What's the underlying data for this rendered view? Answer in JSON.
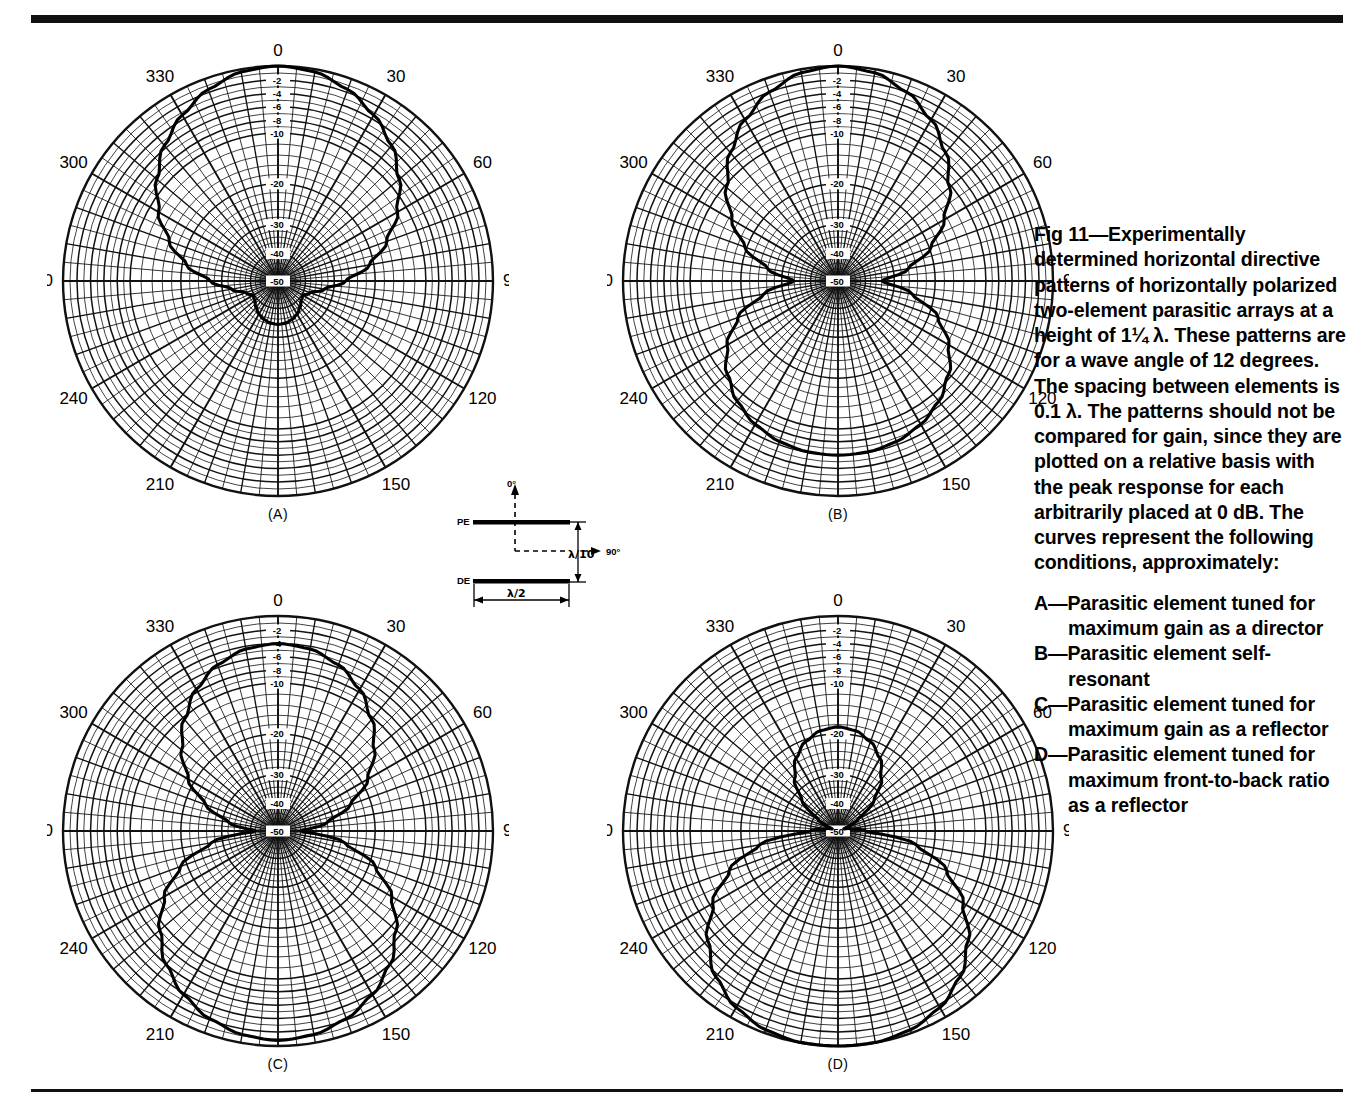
{
  "figure": {
    "caption_paragraph": "Fig 11—Experimentally determined horizontal directive patterns of horizontally polarized two-element parasitic arrays at a height of 1¼ λ. These patterns are for a wave angle of 12 degrees. The spacing between elements is 0.1 λ. The patterns should not be compared for gain, since they are plotted on a relative basis with the peak response for each arbitrarily placed at 0 dB. The curves represent the following conditions, approximately:",
    "conditions": [
      "A—Parasitic element tuned for maximum gain as a director",
      "B—Parasitic element self-resonant",
      "C—Parasitic element tuned for maximum gain as a reflector",
      "D—Parasitic element tuned for maximum front-to-back ratio as a reflector"
    ]
  },
  "antenna_diagram": {
    "parasitic_element_label": "PE",
    "driven_element_label": "DE",
    "spacing_label": "λ/10",
    "length_label": "λ/2",
    "direction_up_label": "0°",
    "direction_right_label": "90°"
  },
  "panels": [
    {
      "id": "A",
      "label": "(A)"
    },
    {
      "id": "B",
      "label": "(B)"
    },
    {
      "id": "C",
      "label": "(C)"
    },
    {
      "id": "D",
      "label": "(D)"
    }
  ],
  "chart_data": [
    {
      "type": "line",
      "plot_kind": "polar-antenna-pattern",
      "panel": "A",
      "title": "(A)",
      "annotation": "Parasitic element tuned for maximum gain as a director",
      "angle_unit": "degrees",
      "angle_tick_labels": [
        "0",
        "30",
        "60",
        "90",
        "120",
        "150",
        "180",
        "210",
        "240",
        "270",
        "300",
        "330"
      ],
      "angle_ticks": [
        0,
        30,
        60,
        90,
        120,
        150,
        180,
        210,
        240,
        270,
        300,
        330
      ],
      "angle_minor_step": 5,
      "radial_unit": "dB",
      "radial_tick_labels": [
        "-2",
        "-4",
        "-6",
        "-8",
        "-10",
        "-20",
        "-30",
        "-40",
        "-50"
      ],
      "radial_ticks": [
        -2,
        -4,
        -6,
        -8,
        -10,
        -20,
        -30,
        -40,
        -50
      ],
      "rlim": [
        -50,
        0
      ],
      "grid": true,
      "legend": "none",
      "angles": [
        0,
        10,
        20,
        30,
        40,
        50,
        60,
        70,
        80,
        90,
        100,
        110,
        120,
        130,
        140,
        150,
        160,
        170,
        180,
        190,
        200,
        210,
        220,
        230,
        240,
        250,
        260,
        270,
        280,
        290,
        300,
        310,
        320,
        330,
        340,
        350
      ],
      "values_db": [
        0,
        -0.4,
        -1.6,
        -3.4,
        -5.6,
        -8.4,
        -11.8,
        -16.0,
        -21.0,
        -27.0,
        -33.0,
        -37.5,
        -39.5,
        -39.0,
        -37.5,
        -36.0,
        -35.0,
        -34.4,
        -34.2,
        -34.4,
        -35.0,
        -36.0,
        -37.5,
        -39.0,
        -39.5,
        -37.5,
        -33.0,
        -27.0,
        -21.0,
        -16.0,
        -11.8,
        -8.4,
        -5.6,
        -3.4,
        -1.6,
        -0.4
      ]
    },
    {
      "type": "line",
      "plot_kind": "polar-antenna-pattern",
      "panel": "B",
      "title": "(B)",
      "annotation": "Parasitic element self-resonant",
      "angle_unit": "degrees",
      "angle_tick_labels": [
        "0",
        "30",
        "60",
        "90",
        "120",
        "150",
        "180",
        "210",
        "240",
        "270",
        "300",
        "330"
      ],
      "angle_ticks": [
        0,
        30,
        60,
        90,
        120,
        150,
        180,
        210,
        240,
        270,
        300,
        330
      ],
      "angle_minor_step": 5,
      "radial_unit": "dB",
      "radial_tick_labels": [
        "-2",
        "-4",
        "-6",
        "-8",
        "-10",
        "-20",
        "-30",
        "-40",
        "-50"
      ],
      "radial_ticks": [
        -2,
        -4,
        -6,
        -8,
        -10,
        -20,
        -30,
        -40,
        -50
      ],
      "rlim": [
        -50,
        0
      ],
      "grid": true,
      "legend": "none",
      "angles": [
        0,
        10,
        20,
        30,
        40,
        50,
        60,
        70,
        80,
        90,
        100,
        110,
        120,
        130,
        140,
        150,
        160,
        170,
        180,
        190,
        200,
        210,
        220,
        230,
        240,
        250,
        260,
        270,
        280,
        290,
        300,
        310,
        320,
        330,
        340,
        350
      ],
      "values_db": [
        0,
        -0.5,
        -2.0,
        -4.2,
        -7.0,
        -10.4,
        -14.6,
        -19.6,
        -26.0,
        -34.0,
        -25.0,
        -18.0,
        -13.6,
        -10.6,
        -8.6,
        -7.3,
        -6.5,
        -6.1,
        -6.0,
        -6.1,
        -6.5,
        -7.3,
        -8.6,
        -10.6,
        -13.6,
        -18.0,
        -25.0,
        -34.0,
        -26.0,
        -19.6,
        -14.6,
        -10.4,
        -7.0,
        -4.2,
        -2.0,
        -0.5
      ]
    },
    {
      "type": "line",
      "plot_kind": "polar-antenna-pattern",
      "panel": "C",
      "title": "(C)",
      "annotation": "Parasitic element tuned for maximum gain as a reflector",
      "angle_unit": "degrees",
      "angle_tick_labels": [
        "0",
        "30",
        "60",
        "90",
        "120",
        "150",
        "180",
        "210",
        "240",
        "270",
        "300",
        "330"
      ],
      "angle_ticks": [
        0,
        30,
        60,
        90,
        120,
        150,
        180,
        210,
        240,
        270,
        300,
        330
      ],
      "angle_minor_step": 5,
      "radial_unit": "dB",
      "radial_tick_labels": [
        "-2",
        "-4",
        "-6",
        "-8",
        "-10",
        "-20",
        "-30",
        "-40",
        "-50"
      ],
      "radial_ticks": [
        -2,
        -4,
        -6,
        -8,
        -10,
        -20,
        -30,
        -40,
        -50
      ],
      "rlim": [
        -50,
        0
      ],
      "grid": true,
      "legend": "none",
      "angles": [
        0,
        10,
        20,
        30,
        40,
        50,
        60,
        70,
        80,
        90,
        100,
        110,
        120,
        130,
        140,
        150,
        160,
        170,
        180,
        190,
        200,
        210,
        220,
        230,
        240,
        250,
        260,
        270,
        280,
        290,
        300,
        310,
        320,
        330,
        340,
        350
      ],
      "values_db": [
        -4.0,
        -4.4,
        -5.6,
        -7.6,
        -10.4,
        -14.0,
        -18.6,
        -24.6,
        -32.0,
        -42.0,
        -27.0,
        -18.6,
        -13.0,
        -9.0,
        -6.0,
        -3.8,
        -2.2,
        -1.2,
        -0.8,
        -1.2,
        -2.2,
        -3.8,
        -6.0,
        -9.0,
        -13.0,
        -18.6,
        -27.0,
        -42.0,
        -32.0,
        -24.6,
        -18.6,
        -14.0,
        -10.4,
        -7.6,
        -5.6,
        -4.4
      ]
    },
    {
      "type": "line",
      "plot_kind": "polar-antenna-pattern",
      "panel": "D",
      "title": "(D)",
      "annotation": "Parasitic element tuned for maximum front-to-back ratio as a reflector",
      "angle_unit": "degrees",
      "angle_tick_labels": [
        "0",
        "30",
        "60",
        "90",
        "120",
        "150",
        "180",
        "210",
        "240",
        "270",
        "300",
        "330"
      ],
      "angle_ticks": [
        0,
        30,
        60,
        90,
        120,
        150,
        180,
        210,
        240,
        270,
        300,
        330
      ],
      "angle_minor_step": 5,
      "radial_unit": "dB",
      "radial_tick_labels": [
        "-2",
        "-4",
        "-6",
        "-8",
        "-10",
        "-20",
        "-30",
        "-40",
        "-50"
      ],
      "radial_ticks": [
        -2,
        -4,
        -6,
        -8,
        -10,
        -20,
        -30,
        -40,
        -50
      ],
      "rlim": [
        -50,
        0
      ],
      "grid": true,
      "legend": "none",
      "angles": [
        0,
        10,
        20,
        30,
        40,
        50,
        60,
        70,
        80,
        90,
        100,
        110,
        120,
        130,
        140,
        150,
        160,
        170,
        180,
        190,
        200,
        210,
        220,
        230,
        240,
        250,
        260,
        270,
        280,
        290,
        300,
        310,
        320,
        330,
        340,
        350
      ],
      "values_db": [
        -18.5,
        -19.0,
        -20.5,
        -23.0,
        -27.0,
        -33.0,
        -42.0,
        -48.0,
        -46.0,
        -40.0,
        -24.0,
        -16.0,
        -10.6,
        -6.6,
        -3.6,
        -1.6,
        -0.5,
        -0.05,
        0,
        -0.05,
        -0.5,
        -1.6,
        -3.6,
        -6.6,
        -10.6,
        -16.0,
        -24.0,
        -40.0,
        -46.0,
        -48.0,
        -42.0,
        -33.0,
        -27.0,
        -23.0,
        -20.5,
        -19.0
      ]
    }
  ]
}
